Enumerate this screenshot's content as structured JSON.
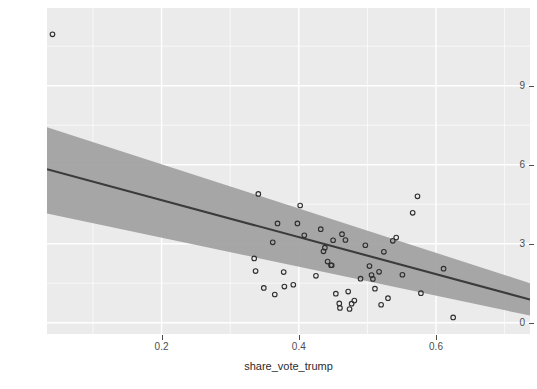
{
  "chart": {
    "title": "",
    "background_color": "#ebebeb",
    "grid_color": "#ffffff",
    "point_color": "#2e2e2e",
    "line_color": "#3b3b3b",
    "ribbon_color": "#9f9f9f"
  },
  "axes": {
    "x": {
      "label": "share_vote_trump",
      "ticks": [
        "0.2",
        "0.4",
        "0.6"
      ],
      "tick_values": [
        0.2,
        0.4,
        0.6
      ],
      "minor_tick_values": [
        0.1,
        0.3,
        0.5,
        0.7
      ],
      "range": [
        0.033,
        0.737
      ]
    },
    "y": {
      "label": "avg_hatecrimes_per_100k_fbi",
      "ticks": [
        "0",
        "3",
        "6",
        "9"
      ],
      "tick_values": [
        0,
        3,
        6,
        9
      ],
      "minor_tick_values": [
        1.5,
        4.5,
        7.5,
        10.5
      ],
      "range": [
        -0.43,
        11.95
      ]
    }
  },
  "chart_data": {
    "type": "scatter",
    "title": "",
    "xlabel": "share_vote_trump",
    "ylabel": "avg_hatecrimes_per_100k_fbi",
    "xlim": [
      0.033,
      0.737
    ],
    "ylim": [
      -0.43,
      11.95
    ],
    "grid": true,
    "legend": "none",
    "series": [
      {
        "name": "states",
        "type": "scatter",
        "marker": "open-circle",
        "points": [
          [
            0.041,
            10.95
          ],
          [
            0.335,
            2.44
          ],
          [
            0.337,
            1.96
          ],
          [
            0.341,
            4.89
          ],
          [
            0.349,
            1.32
          ],
          [
            0.362,
            3.05
          ],
          [
            0.365,
            1.07
          ],
          [
            0.369,
            3.77
          ],
          [
            0.378,
            1.92
          ],
          [
            0.379,
            1.37
          ],
          [
            0.392,
            1.44
          ],
          [
            0.398,
            3.77
          ],
          [
            0.402,
            4.45
          ],
          [
            0.408,
            3.32
          ],
          [
            0.425,
            1.78
          ],
          [
            0.432,
            3.55
          ],
          [
            0.436,
            2.71
          ],
          [
            0.438,
            2.85
          ],
          [
            0.442,
            2.32
          ],
          [
            0.447,
            2.18
          ],
          [
            0.448,
            2.18
          ],
          [
            0.45,
            3.13
          ],
          [
            0.454,
            1.1
          ],
          [
            0.459,
            0.73
          ],
          [
            0.46,
            0.56
          ],
          [
            0.463,
            3.36
          ],
          [
            0.468,
            3.14
          ],
          [
            0.472,
            1.18
          ],
          [
            0.474,
            0.52
          ],
          [
            0.477,
            0.72
          ],
          [
            0.481,
            0.84
          ],
          [
            0.49,
            1.67
          ],
          [
            0.497,
            2.94
          ],
          [
            0.503,
            2.15
          ],
          [
            0.506,
            1.81
          ],
          [
            0.508,
            1.66
          ],
          [
            0.511,
            1.29
          ],
          [
            0.517,
            1.93
          ],
          [
            0.52,
            0.68
          ],
          [
            0.524,
            2.69
          ],
          [
            0.53,
            0.93
          ],
          [
            0.537,
            3.11
          ],
          [
            0.542,
            3.23
          ],
          [
            0.551,
            1.82
          ],
          [
            0.566,
            4.17
          ],
          [
            0.573,
            4.8
          ],
          [
            0.578,
            1.12
          ],
          [
            0.611,
            2.05
          ],
          [
            0.625,
            0.2
          ]
        ]
      },
      {
        "name": "linear fit",
        "type": "line",
        "x": [
          0.033,
          0.737
        ],
        "y": [
          5.83,
          0.88
        ]
      },
      {
        "name": "95% confidence band",
        "type": "ribbon",
        "x": [
          0.033,
          0.737
        ],
        "ymin": [
          4.15,
          0.27
        ],
        "ymax": [
          7.42,
          1.5
        ]
      }
    ]
  }
}
